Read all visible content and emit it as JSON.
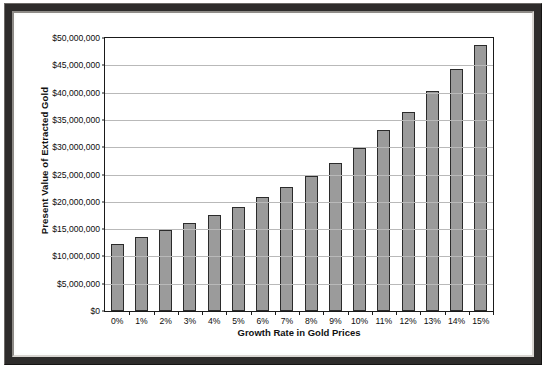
{
  "chart_data": {
    "type": "bar",
    "title": "",
    "xlabel": "Growth Rate in Gold Prices",
    "ylabel": "Present Value of Extracted Gold",
    "categories": [
      "0%",
      "1%",
      "2%",
      "3%",
      "4%",
      "5%",
      "6%",
      "7%",
      "8%",
      "9%",
      "10%",
      "11%",
      "12%",
      "13%",
      "14%",
      "15%"
    ],
    "values": [
      12300000,
      13500000,
      14900000,
      16200000,
      17500000,
      19100000,
      20800000,
      22700000,
      24700000,
      27100000,
      29900000,
      33100000,
      36400000,
      40300000,
      44300000,
      48800000
    ],
    "ylim": [
      0,
      50000000
    ],
    "ytick_values": [
      0,
      5000000,
      10000000,
      15000000,
      20000000,
      25000000,
      30000000,
      35000000,
      40000000,
      45000000,
      50000000
    ],
    "ytick_labels": [
      "$0",
      "$5,000,000",
      "$10,000,000",
      "$15,000,000",
      "$20,000,000",
      "$25,000,000",
      "$30,000,000",
      "$35,000,000",
      "$40,000,000",
      "$45,000,000",
      "$50,000,000"
    ],
    "grid": true,
    "legend": false,
    "bar_color": "#9b9b9b",
    "bar_border_color": "#2b2b2b",
    "axis_color": "#1a1a1a",
    "gridline_color": "#b9b9b9",
    "frame_color": "#2e2c2b",
    "plot_background": "#ffffff"
  }
}
